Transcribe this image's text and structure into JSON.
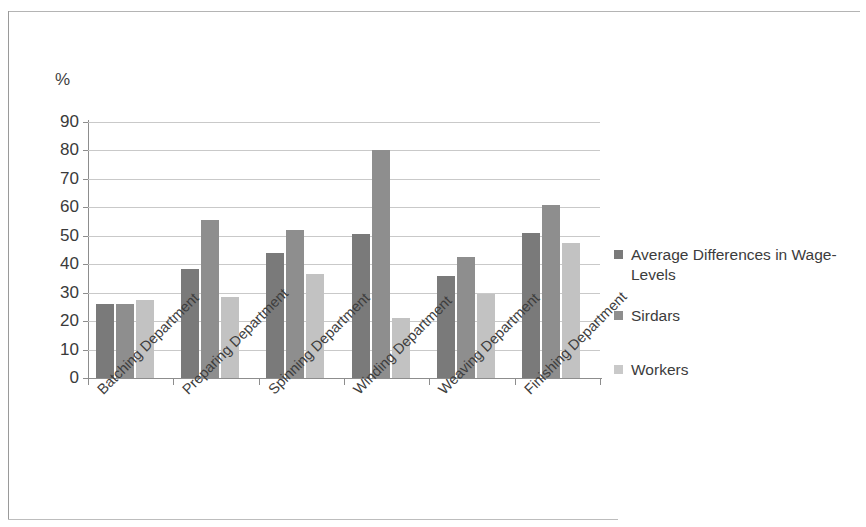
{
  "chart_data": {
    "type": "bar",
    "title": "",
    "subtitle": "",
    "xlabel": "",
    "ylabel": "%",
    "ylim": [
      0,
      90
    ],
    "yticks": [
      0,
      10,
      20,
      30,
      40,
      50,
      60,
      70,
      80,
      90
    ],
    "ytick_labels": [
      "0",
      "10",
      "20",
      "30",
      "40",
      "50",
      "60",
      "70",
      "80",
      "90"
    ],
    "grid": true,
    "legend_position": "right",
    "categories": [
      "Batching Department",
      "Preparing Department",
      "Spinning Department",
      "Winding Department",
      "Weaving Department",
      "Finishing Department"
    ],
    "series": [
      {
        "name": "Average Differences in Wage-Levels",
        "color": "#7a7a7a",
        "values": [
          26,
          38.5,
          44,
          50.5,
          36,
          51
        ]
      },
      {
        "name": "Sirdars",
        "color": "#8e8e8e",
        "values": [
          26,
          55.5,
          52,
          80,
          42.5,
          61
        ]
      },
      {
        "name": "Workers",
        "color": "#c2c2c2",
        "values": [
          27.5,
          28.5,
          36.5,
          21,
          29.5,
          47.5
        ]
      }
    ]
  },
  "axis": {
    "unit_caption": "%"
  },
  "legend": {
    "entries": [
      {
        "label": "Average Differences in Wage-Levels",
        "swatch": "series-0-swatch"
      },
      {
        "label": "Sirdars",
        "swatch": "series-1-swatch"
      },
      {
        "label": "Workers",
        "swatch": "series-2-swatch"
      }
    ]
  }
}
